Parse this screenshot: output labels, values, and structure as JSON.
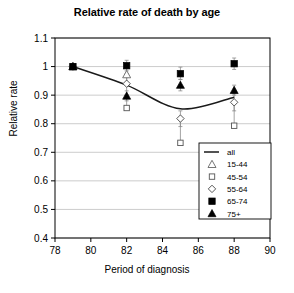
{
  "chart_data": {
    "type": "scatter",
    "title": "Relative rate of death by age",
    "xlabel": "Period of diagnosis",
    "ylabel": "Relative rate",
    "xlim": [
      78,
      90
    ],
    "ylim": [
      0.4,
      1.1
    ],
    "xticks": [
      78,
      80,
      82,
      84,
      86,
      88,
      90
    ],
    "yticks": [
      0.4,
      0.5,
      0.6,
      0.7,
      0.8,
      0.9,
      1.0,
      1.1
    ],
    "ytick_labels": [
      "0.4",
      "0.5",
      "0.6",
      "0.7",
      "0.8",
      "0.9",
      "1",
      "1.1"
    ],
    "xtick_labels": [
      "78",
      "80",
      "82",
      "84",
      "86",
      "88",
      "90"
    ],
    "grid": "horizontal",
    "legend_position": "bottom-right",
    "x": [
      79,
      82,
      85,
      88
    ],
    "series": [
      {
        "name": "all",
        "marker": "line",
        "style": "solid-line",
        "values": [
          1.0,
          0.935,
          0.852,
          0.893
        ]
      },
      {
        "name": "15-44",
        "marker": "open-triangle",
        "values": [
          1.0,
          0.972,
          null,
          null
        ],
        "err_low": [
          null,
          0.94,
          null,
          null
        ],
        "err_high": [
          null,
          1.005,
          null,
          null
        ]
      },
      {
        "name": "45-54",
        "marker": "open-square",
        "values": [
          1.0,
          0.855,
          0.733,
          0.793
        ],
        "err_low": [
          null,
          0.85,
          0.733,
          0.793
        ],
        "err_high": [
          null,
          0.9,
          0.815,
          0.877
        ]
      },
      {
        "name": "55-64",
        "marker": "open-diamond",
        "values": [
          1.0,
          0.94,
          0.818,
          0.875
        ],
        "err_low": [
          null,
          0.9,
          0.79,
          0.845
        ],
        "err_high": [
          null,
          0.975,
          0.845,
          0.905
        ]
      },
      {
        "name": "65-74",
        "marker": "filled-square",
        "values": [
          1.0,
          1.003,
          0.975,
          1.01
        ],
        "err_low": [
          null,
          0.985,
          0.955,
          0.99
        ],
        "err_high": [
          null,
          1.022,
          0.998,
          1.03
        ]
      },
      {
        "name": "75+",
        "marker": "filled-triangle",
        "values": [
          1.0,
          0.897,
          0.935,
          0.917
        ],
        "err_low": [
          null,
          0.88,
          0.915,
          0.9
        ],
        "err_high": [
          null,
          0.915,
          0.955,
          0.935
        ]
      }
    ],
    "legend_entries": [
      {
        "label": "all",
        "marker": "line"
      },
      {
        "label": "15-44",
        "marker": "open-triangle"
      },
      {
        "label": "45-54",
        "marker": "open-square"
      },
      {
        "label": "55-64",
        "marker": "open-diamond"
      },
      {
        "label": "65-74",
        "marker": "filled-square"
      },
      {
        "label": "75+",
        "marker": "filled-triangle"
      }
    ],
    "colors": {
      "axis": "#000000",
      "grid": "#bfbfbf",
      "marker_fill": "#000000",
      "marker_open": "#ffffff",
      "line": "#1a1a1a",
      "background": "#ffffff"
    }
  }
}
